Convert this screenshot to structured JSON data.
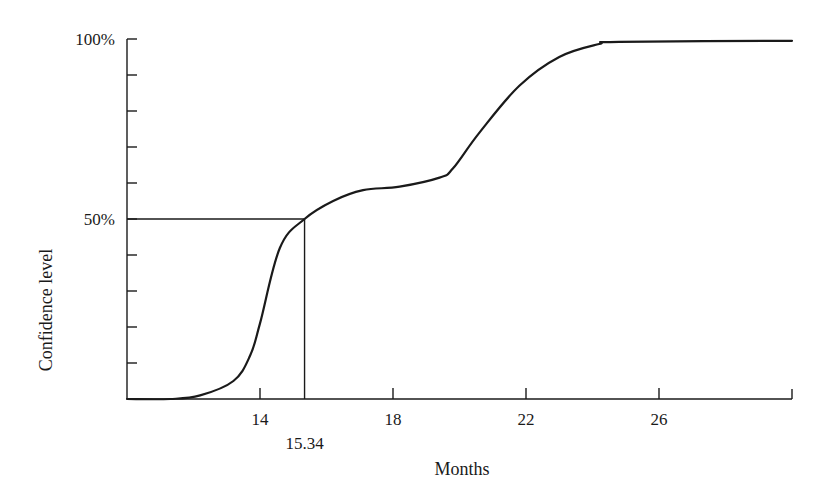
{
  "chart_data": {
    "type": "line",
    "title": "",
    "xlabel": "Months",
    "ylabel": "Confidence level",
    "xlim": [
      10,
      30
    ],
    "ylim": [
      0,
      100
    ],
    "grid": false,
    "legend": "none",
    "x_ticks": [
      14,
      18,
      22,
      26
    ],
    "x_tick_labels": [
      "14",
      "18",
      "22",
      "26"
    ],
    "y_ticks": [
      0,
      10,
      20,
      30,
      40,
      50,
      60,
      70,
      80,
      90,
      100
    ],
    "y_tick_labels": [
      {
        "value": 50,
        "label": "50%"
      },
      {
        "value": 100,
        "label": "100%"
      }
    ],
    "series": [
      {
        "name": "Cumulative confidence",
        "x": [
          10,
          11.3,
          12.2,
          13.2,
          13.7,
          14.0,
          14.6,
          15.34,
          16.2,
          17.1,
          18.2,
          19.4,
          19.8,
          20.6,
          21.8,
          23.0,
          24.2,
          24.8,
          30
        ],
        "y": [
          0,
          0,
          1,
          5,
          12,
          21,
          42,
          50,
          55,
          58,
          59,
          61.5,
          64,
          74,
          87,
          95,
          98.6,
          99.2,
          99.5
        ]
      }
    ],
    "annotations": [
      {
        "type": "reference-lines",
        "x": 15.34,
        "y": 50,
        "label": "15.34"
      }
    ]
  }
}
